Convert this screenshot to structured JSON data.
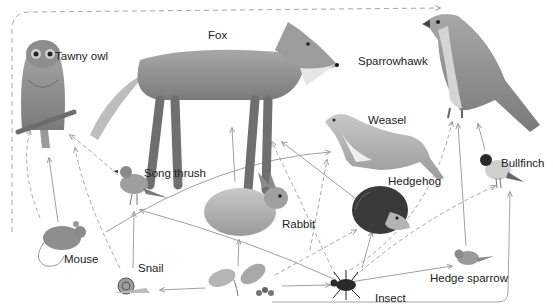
{
  "diagram": {
    "colors": {
      "arrow": "#9a9a9a",
      "label": "#222222",
      "background": "#ffffff"
    },
    "organisms": [
      {
        "id": "tawny-owl",
        "label": "Tawny owl"
      },
      {
        "id": "fox",
        "label": "Fox"
      },
      {
        "id": "sparrowhawk",
        "label": "Sparrowhawk"
      },
      {
        "id": "weasel",
        "label": "Weasel"
      },
      {
        "id": "song-thrush",
        "label": "Song thrush"
      },
      {
        "id": "bullfinch",
        "label": "Bullfinch"
      },
      {
        "id": "hedgehog",
        "label": "Hedgehog"
      },
      {
        "id": "rabbit",
        "label": "Rabbit"
      },
      {
        "id": "mouse",
        "label": "Mouse"
      },
      {
        "id": "snail",
        "label": "Snail"
      },
      {
        "id": "insect",
        "label": "Insect"
      },
      {
        "id": "hedge-sparrow",
        "label": "Hedge sparrow"
      },
      {
        "id": "plants",
        "label": ""
      }
    ],
    "links": [
      {
        "from": "mouse",
        "to": "tawny-owl",
        "style": "solid"
      },
      {
        "from": "mouse",
        "to": "fox",
        "style": "dashed"
      },
      {
        "from": "song-thrush",
        "to": "tawny-owl",
        "style": "dashed"
      },
      {
        "from": "snail",
        "to": "tawny-owl",
        "style": "dashed"
      },
      {
        "from": "snail",
        "to": "song-thrush",
        "style": "solid"
      },
      {
        "from": "rabbit",
        "to": "fox",
        "style": "solid"
      },
      {
        "from": "insect",
        "to": "fox",
        "style": "dashed"
      },
      {
        "from": "mouse",
        "to": "weasel",
        "style": "solid"
      },
      {
        "from": "hedgehog",
        "to": "weasel",
        "style": "solid"
      },
      {
        "from": "plants",
        "to": "weasel",
        "style": "dashed"
      },
      {
        "from": "insect",
        "to": "hedgehog",
        "style": "solid"
      },
      {
        "from": "plants",
        "to": "hedgehog",
        "style": "dashed"
      },
      {
        "from": "plants",
        "to": "rabbit",
        "style": "solid"
      },
      {
        "from": "plants",
        "to": "mouse",
        "style": "solid"
      },
      {
        "from": "plants",
        "to": "insect",
        "style": "solid"
      },
      {
        "from": "plants",
        "to": "snail",
        "style": "solid"
      },
      {
        "from": "insect",
        "to": "song-thrush",
        "style": "solid"
      },
      {
        "from": "insect",
        "to": "hedge-sparrow",
        "style": "solid"
      },
      {
        "from": "insect",
        "to": "bullfinch",
        "style": "dashed"
      },
      {
        "from": "insect",
        "to": "sparrowhawk",
        "style": "dashed"
      },
      {
        "from": "hedge-sparrow",
        "to": "sparrowhawk",
        "style": "solid"
      },
      {
        "from": "bullfinch",
        "to": "sparrowhawk",
        "style": "solid"
      },
      {
        "from": "plants",
        "to": "bullfinch",
        "style": "solid"
      },
      {
        "from": "tawny-owl",
        "to": "sparrowhawk",
        "style": "dashed"
      },
      {
        "from": "song-thrush",
        "to": "weasel",
        "style": "solid"
      }
    ]
  }
}
